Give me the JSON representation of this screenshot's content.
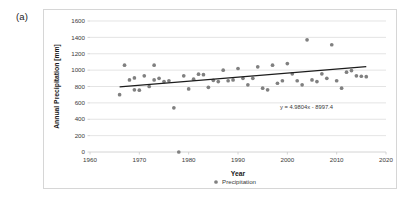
{
  "figure": {
    "panel_label": "(a)"
  },
  "chart_data": {
    "type": "scatter",
    "title": "",
    "xlabel": "Year",
    "ylabel": "Annual Precipitation [mm]",
    "xlim": [
      1960,
      2020
    ],
    "ylim": [
      0,
      1600
    ],
    "xticks": [
      1960,
      1970,
      1980,
      1990,
      2000,
      2010,
      2020
    ],
    "yticks": [
      0,
      200,
      400,
      600,
      800,
      1000,
      1200,
      1400,
      1600
    ],
    "grid": true,
    "legend": {
      "position": "bottom",
      "entries": [
        {
          "label": "Precipitation",
          "marker": "circle",
          "color": "#808080"
        }
      ]
    },
    "series": [
      {
        "name": "Precipitation",
        "marker": "circle",
        "color": "#808080",
        "points": [
          [
            1966,
            700
          ],
          [
            1967,
            1060
          ],
          [
            1968,
            880
          ],
          [
            1969,
            905
          ],
          [
            1969,
            760
          ],
          [
            1970,
            755
          ],
          [
            1971,
            930
          ],
          [
            1972,
            800
          ],
          [
            1973,
            1060
          ],
          [
            1973,
            880
          ],
          [
            1974,
            900
          ],
          [
            1975,
            860
          ],
          [
            1976,
            870
          ],
          [
            1977,
            540
          ],
          [
            1978,
            0
          ],
          [
            1979,
            930
          ],
          [
            1980,
            770
          ],
          [
            1981,
            890
          ],
          [
            1982,
            950
          ],
          [
            1983,
            945
          ],
          [
            1984,
            790
          ],
          [
            1985,
            875
          ],
          [
            1986,
            860
          ],
          [
            1987,
            1000
          ],
          [
            1988,
            870
          ],
          [
            1989,
            880
          ],
          [
            1990,
            1020
          ],
          [
            1991,
            900
          ],
          [
            1992,
            820
          ],
          [
            1993,
            900
          ],
          [
            1994,
            1040
          ],
          [
            1995,
            780
          ],
          [
            1996,
            760
          ],
          [
            1997,
            1060
          ],
          [
            1998,
            840
          ],
          [
            1999,
            870
          ],
          [
            2000,
            1080
          ],
          [
            2001,
            955
          ],
          [
            2002,
            870
          ],
          [
            2003,
            820
          ],
          [
            2004,
            1370
          ],
          [
            2005,
            880
          ],
          [
            2006,
            860
          ],
          [
            2007,
            955
          ],
          [
            2008,
            900
          ],
          [
            2009,
            1310
          ],
          [
            2010,
            870
          ],
          [
            2011,
            780
          ],
          [
            2012,
            975
          ],
          [
            2013,
            995
          ],
          [
            2014,
            930
          ],
          [
            2015,
            925
          ],
          [
            2016,
            920
          ]
        ]
      }
    ],
    "trendline": {
      "equation": "y = 4.9804x - 8997.4",
      "slope": 4.9804,
      "intercept": -8997.4,
      "x_start": 1966,
      "x_end": 2016,
      "color": "#1c1c1c"
    }
  }
}
